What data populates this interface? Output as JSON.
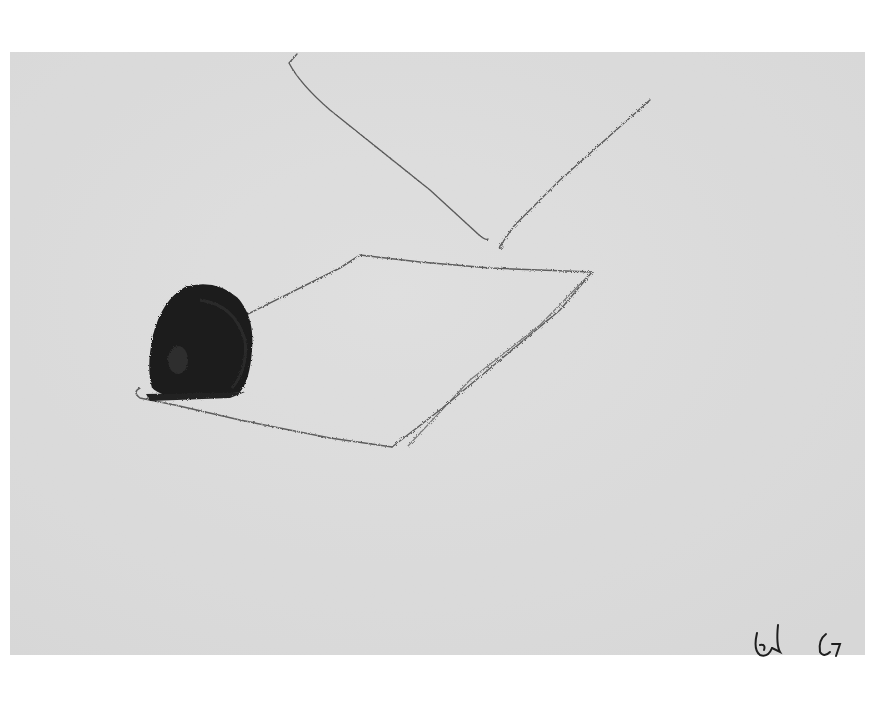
{
  "artwork": {
    "medium_description": "pencil and graphite drawing on gray paper",
    "paper_color": "#dcdcdc",
    "background_color": "#ffffff",
    "line_color": "#555555",
    "mass_color": "#1a1a1a",
    "elements": [
      "open V-shaped line at top",
      "tilted rectangular plane outline",
      "dark scribbled rounded form resting on plane"
    ],
    "signature": "Ed 67"
  }
}
